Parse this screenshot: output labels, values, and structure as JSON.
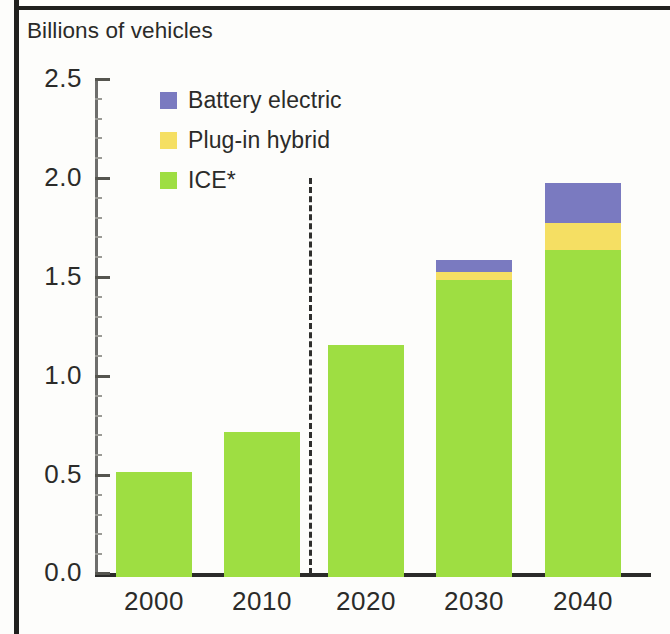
{
  "figure": {
    "title": "Billions of vehicles"
  },
  "legend": {
    "items": [
      {
        "label": "Battery electric",
        "color": "#7a7ac0",
        "key": "bev"
      },
      {
        "label": "Plug-in hybrid",
        "color": "#f5df63",
        "key": "phev"
      },
      {
        "label": "ICE*",
        "color": "#9ede42",
        "key": "ice"
      }
    ]
  },
  "axes": {
    "y_ticks": [
      "2.5",
      "2.0",
      "1.5",
      "1.0",
      "0.5",
      "0.0"
    ],
    "x_ticks": [
      "2000",
      "2010",
      "2020",
      "2030",
      "2040"
    ]
  },
  "annotations": {
    "forecast_divider": "dashed-vertical-line"
  },
  "chart_data": {
    "type": "bar",
    "stacked": true,
    "title": "Billions of vehicles",
    "xlabel": "",
    "ylabel": "Billions of vehicles",
    "ylim": [
      0.0,
      2.5
    ],
    "ytick_step": 0.5,
    "grid": false,
    "legend_position": "top-left-inside",
    "categories": [
      "2000",
      "2010",
      "2020",
      "2030",
      "2040"
    ],
    "series": [
      {
        "name": "ICE*",
        "color": "#9ede42",
        "values": [
          0.53,
          0.73,
          1.17,
          1.5,
          1.65
        ]
      },
      {
        "name": "Plug-in hybrid",
        "color": "#f5df63",
        "values": [
          0.0,
          0.0,
          0.0,
          0.04,
          0.14
        ]
      },
      {
        "name": "Battery electric",
        "color": "#7a7ac0",
        "values": [
          0.0,
          0.0,
          0.0,
          0.06,
          0.2
        ]
      }
    ],
    "totals": [
      0.53,
      0.73,
      1.17,
      1.6,
      1.99
    ],
    "annotations": [
      {
        "type": "vline",
        "style": "dashed",
        "between": [
          "2010",
          "2020"
        ],
        "note": "history / forecast divider"
      }
    ]
  }
}
